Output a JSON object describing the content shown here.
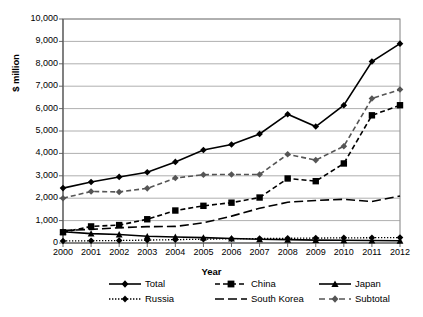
{
  "chart_data": {
    "type": "line",
    "title": "",
    "xlabel": "Year",
    "ylabel": "$ million",
    "x": [
      2000,
      2001,
      2002,
      2003,
      2004,
      2005,
      2006,
      2007,
      2008,
      2009,
      2010,
      2011,
      2012
    ],
    "categories": [
      "2000",
      "2001",
      "2002",
      "2003",
      "2004",
      "2005",
      "2006",
      "2007",
      "2008",
      "2009",
      "2010",
      "2011",
      "2012"
    ],
    "ylim": [
      0,
      10000
    ],
    "yticks": [
      0,
      1000,
      2000,
      3000,
      4000,
      5000,
      6000,
      7000,
      8000,
      9000,
      10000
    ],
    "ytick_labels": [
      "0",
      "1,000",
      "2,000",
      "3,000",
      "4,000",
      "5,000",
      "6,000",
      "7,000",
      "8,000",
      "9,000",
      "10,000"
    ],
    "grid": "horizontal",
    "legend_position": "bottom",
    "series": [
      {
        "name": "Total",
        "marker": "diamond",
        "line_style": "solid",
        "color": "#000000",
        "values": [
          2450,
          2720,
          2950,
          3160,
          3620,
          4150,
          4400,
          4870,
          5750,
          5200,
          6150,
          8100,
          8900
        ]
      },
      {
        "name": "China",
        "marker": "square",
        "line_style": "dashed",
        "color": "#000000",
        "values": [
          480,
          740,
          800,
          1060,
          1450,
          1660,
          1800,
          2030,
          2880,
          2760,
          3550,
          5700,
          6150
        ]
      },
      {
        "name": "Japan",
        "marker": "triangle",
        "line_style": "solid",
        "color": "#000000",
        "values": [
          500,
          420,
          380,
          300,
          270,
          240,
          200,
          170,
          150,
          130,
          120,
          110,
          100
        ]
      },
      {
        "name": "Russia",
        "marker": "diamond",
        "line_style": "dotted",
        "color": "#000000",
        "values": [
          90,
          100,
          110,
          130,
          150,
          170,
          190,
          200,
          210,
          220,
          230,
          235,
          240
        ]
      },
      {
        "name": "South Korea",
        "marker": "none",
        "line_style": "long-dash",
        "color": "#000000",
        "values": [
          560,
          610,
          680,
          730,
          740,
          900,
          1200,
          1550,
          1820,
          1900,
          1950,
          1850,
          2100
        ]
      },
      {
        "name": "Subtotal",
        "marker": "diamond",
        "line_style": "dashed",
        "color": "#555555",
        "values": [
          2000,
          2300,
          2280,
          2440,
          2900,
          3050,
          3060,
          3060,
          3960,
          3700,
          4320,
          6450,
          6850
        ]
      }
    ]
  },
  "legend": {
    "items": [
      {
        "label": "Total"
      },
      {
        "label": "China"
      },
      {
        "label": "Japan"
      },
      {
        "label": "Russia"
      },
      {
        "label": "South Korea"
      },
      {
        "label": "Subtotal"
      }
    ]
  }
}
